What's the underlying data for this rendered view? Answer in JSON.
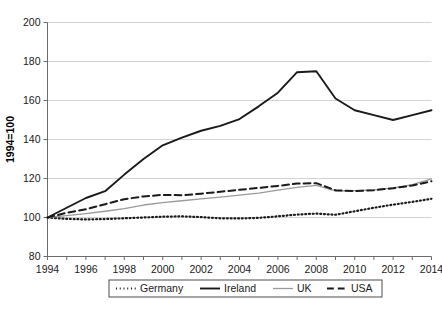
{
  "chart_data": {
    "type": "line",
    "title": "",
    "xlabel": "",
    "ylabel": "1994=100",
    "xlim": [
      1994,
      2014
    ],
    "ylim": [
      80,
      200
    ],
    "ytick_values": [
      80,
      100,
      120,
      140,
      160,
      180,
      200
    ],
    "yticks": [
      "80",
      "100",
      "120",
      "140",
      "160",
      "180",
      "200"
    ],
    "xtick_values": [
      1994,
      1996,
      1998,
      2000,
      2002,
      2004,
      2006,
      2008,
      2010,
      2012,
      2014
    ],
    "xticks": [
      "1994",
      "1996",
      "1998",
      "2000",
      "2002",
      "2004",
      "2006",
      "2008",
      "2010",
      "2012",
      "2014"
    ],
    "grid": "horizontal",
    "legend_position": "bottom",
    "x": [
      1994,
      1995,
      1996,
      1997,
      1998,
      1999,
      2000,
      2001,
      2002,
      2003,
      2004,
      2005,
      2006,
      2007,
      2008,
      2009,
      2010,
      2011,
      2012,
      2013,
      2014
    ],
    "series": [
      {
        "name": "Germany",
        "style": "dotted",
        "color": "#1a1a1a",
        "width": 2.2,
        "values": [
          100,
          99.3,
          99.0,
          99.2,
          99.6,
          100.0,
          100.4,
          100.6,
          100.2,
          99.6,
          99.5,
          99.8,
          100.6,
          101.5,
          102.0,
          101.4,
          103.2,
          105.0,
          106.6,
          108.0,
          109.6
        ]
      },
      {
        "name": "Ireland",
        "style": "solid",
        "color": "#1a1a1a",
        "width": 1.9,
        "values": [
          100,
          105,
          110,
          113.5,
          122,
          130,
          137,
          141,
          144.5,
          147,
          150.5,
          157,
          164,
          174.5,
          175,
          161,
          155,
          152.5,
          150,
          152.5,
          155
        ]
      },
      {
        "name": "UK",
        "style": "solid",
        "color": "#9a9a9a",
        "width": 1.3,
        "values": [
          100,
          101,
          102,
          103.2,
          104.5,
          106.4,
          107.6,
          108.6,
          109.6,
          110.5,
          111.5,
          112.5,
          114.0,
          115.5,
          116.5,
          113.6,
          113.8,
          114.2,
          115.2,
          116.8,
          119.8
        ]
      },
      {
        "name": "USA",
        "style": "dashed",
        "color": "#1a1a1a",
        "width": 2.0,
        "values": [
          100,
          102.4,
          104.2,
          106.8,
          109.4,
          110.8,
          111.6,
          111.4,
          112.2,
          113.2,
          114.2,
          115.2,
          116.2,
          117.4,
          117.6,
          114.0,
          113.5,
          114.0,
          115.0,
          116.4,
          118.6
        ]
      }
    ]
  },
  "legend": {
    "items": [
      {
        "label": "Germany",
        "style": "dotted"
      },
      {
        "label": "Ireland",
        "style": "solid"
      },
      {
        "label": "UK",
        "style": "solid-thin"
      },
      {
        "label": "USA",
        "style": "dashed"
      }
    ]
  },
  "caption": ""
}
